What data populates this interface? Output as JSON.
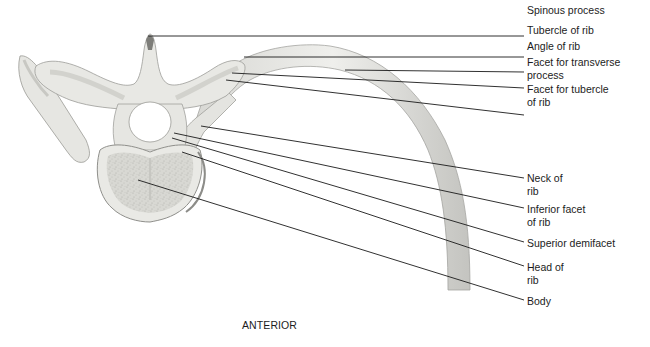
{
  "figure": {
    "view_caption": "ANTERIOR",
    "colors": {
      "bone_fill": "#e9e9e6",
      "bone_shade": "#c9c9c5",
      "bone_dark": "#8f8f8b",
      "body_texture": "#cfcfca",
      "leader_line": "#1a1a1a",
      "text": "#1c1c1c",
      "background": "#ffffff"
    },
    "labels": [
      {
        "id": "spinous-process",
        "text": "Spinous process",
        "x": 527,
        "y": 4
      },
      {
        "id": "tubercle-of-rib",
        "text": "Tubercle of rib",
        "x": 527,
        "y": 24
      },
      {
        "id": "angle-of-rib",
        "text": "Angle of rib",
        "x": 527,
        "y": 40
      },
      {
        "id": "facet-for-transverse-process",
        "text": "Facet for transverse\nprocess",
        "x": 527,
        "y": 56
      },
      {
        "id": "facet-for-tubercle-of-rib",
        "text": "Facet for tubercle\nof rib",
        "x": 527,
        "y": 83
      },
      {
        "id": "neck-of-rib",
        "text": "Neck of\nrib",
        "x": 527,
        "y": 172
      },
      {
        "id": "inferior-facet-of-rib",
        "text": "Inferior facet\nof rib",
        "x": 527,
        "y": 203
      },
      {
        "id": "superior-demifacet",
        "text": "Superior demifacet",
        "x": 527,
        "y": 237
      },
      {
        "id": "head-of-rib",
        "text": "Head of\nrib",
        "x": 527,
        "y": 261
      },
      {
        "id": "body",
        "text": "Body",
        "x": 527,
        "y": 295
      }
    ],
    "leaders": [
      {
        "id": "spinous-process",
        "x1": 148,
        "y1": 36,
        "x2": 524,
        "y2": 36
      },
      {
        "id": "tubercle-of-rib",
        "x1": 244,
        "y1": 57,
        "x2": 524,
        "y2": 57
      },
      {
        "id": "angle-of-rib",
        "x1": 345,
        "y1": 70,
        "x2": 524,
        "y2": 72
      },
      {
        "id": "facet-for-transverse-process",
        "x1": 232,
        "y1": 73,
        "x2": 524,
        "y2": 88
      },
      {
        "id": "facet-for-tubercle-of-rib",
        "x1": 226,
        "y1": 80,
        "x2": 524,
        "y2": 115
      },
      {
        "id": "neck-of-rib",
        "x1": 201,
        "y1": 126,
        "x2": 524,
        "y2": 178
      },
      {
        "id": "inferior-facet-of-rib",
        "x1": 174,
        "y1": 133,
        "x2": 524,
        "y2": 208
      },
      {
        "id": "superior-demifacet",
        "x1": 172,
        "y1": 138,
        "x2": 524,
        "y2": 242
      },
      {
        "id": "head-of-rib",
        "x1": 182,
        "y1": 152,
        "x2": 524,
        "y2": 266
      },
      {
        "id": "body",
        "x1": 138,
        "y1": 180,
        "x2": 524,
        "y2": 300
      }
    ]
  }
}
